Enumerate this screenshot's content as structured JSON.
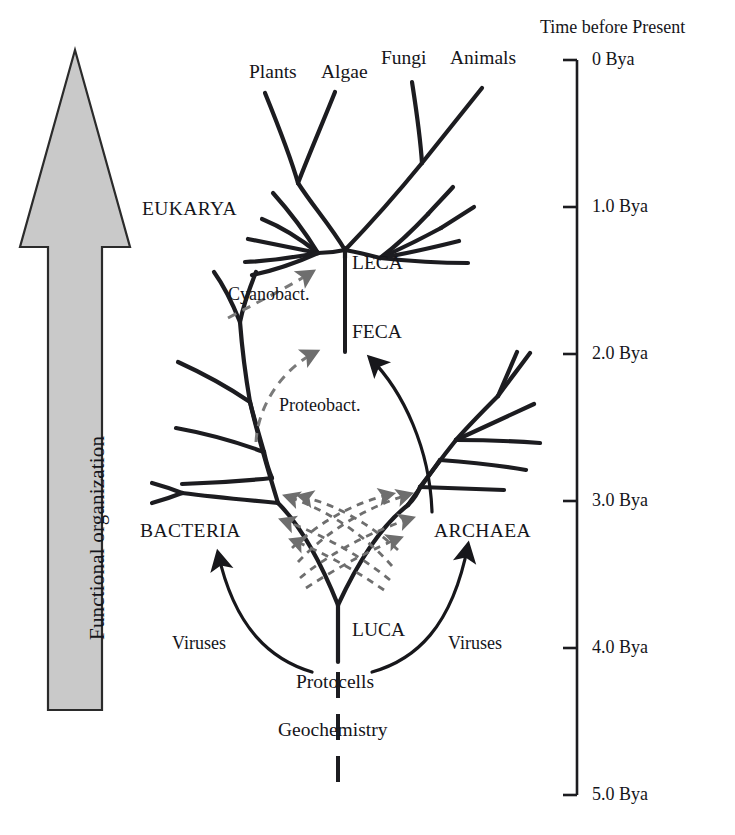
{
  "figure": {
    "type": "phylogenetic-tree"
  },
  "axis": {
    "title": "Time before Present",
    "unit": "Bya",
    "ticks": [
      {
        "label": "0 Bya",
        "value": 0
      },
      {
        "label": "1.0 Bya",
        "value": 1.0
      },
      {
        "label": "2.0 Bya",
        "value": 2.0
      },
      {
        "label": "3.0 Bya",
        "value": 3.0
      },
      {
        "label": "4.0 Bya",
        "value": 4.0
      },
      {
        "label": "5.0 Bya",
        "value": 5.0
      }
    ]
  },
  "gradient_arrow": {
    "label": "Functional organization",
    "direction": "up",
    "fill_color": "#c9c9c9",
    "stroke_color": "#2b2b2b"
  },
  "tips": [
    {
      "label": "Plants"
    },
    {
      "label": "Algae"
    },
    {
      "label": "Fungi"
    },
    {
      "label": "Animals"
    }
  ],
  "domains": [
    {
      "label": "EUKARYA"
    },
    {
      "label": "BACTERIA"
    },
    {
      "label": "ARCHAEA"
    }
  ],
  "nodes": [
    {
      "label": "LECA"
    },
    {
      "label": "FECA"
    },
    {
      "label": "LUCA"
    },
    {
      "label": "Protocells"
    },
    {
      "label": "Geochemistry"
    }
  ],
  "endosymbiosis": [
    {
      "label": "Cyanobact.",
      "target": "LECA",
      "style": "dashed",
      "color": "#7a7a7a"
    },
    {
      "label": "Proteobact.",
      "target": "FECA",
      "style": "dashed",
      "color": "#7a7a7a"
    }
  ],
  "virus_arrows": [
    {
      "label": "Viruses",
      "target": "BACTERIA"
    },
    {
      "label": "Viruses",
      "target": "ARCHAEA"
    }
  ],
  "hgt": {
    "style": "dashed",
    "color": "#6e6e6e",
    "arrow_pairs": 4,
    "description": "Crossing horizontal gene transfer arrows between Bacteria and Archaea"
  },
  "colors": {
    "ink": "#15151a",
    "branch": "#1c1c20",
    "gray_dash": "#7a7a7a",
    "arrow_fill": "#c9c9c9"
  }
}
